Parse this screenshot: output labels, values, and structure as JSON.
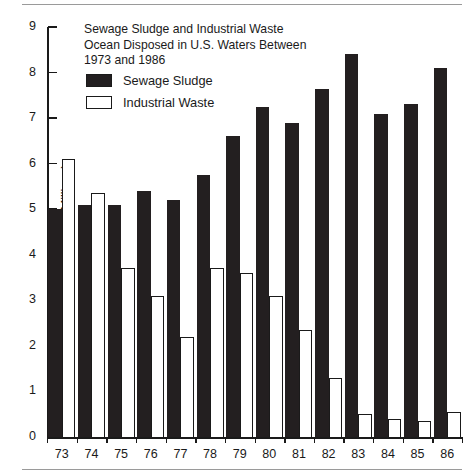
{
  "chart_data": {
    "type": "bar",
    "title": "Sewage Sludge and Industrial Waste\nOcean Disposed in U.S. Waters Between\n1973 and 1986",
    "title_lines": [
      "Sewage Sludge and Industrial Waste",
      "Ocean Disposed in U.S. Waters Between",
      "1973 and 1986"
    ],
    "xlabel": "",
    "ylabel": "Wet Tons (Millions)",
    "ylim": [
      0,
      9
    ],
    "ytick_labels": [
      "0",
      "1",
      "2",
      "3",
      "4",
      "5",
      "6",
      "7",
      "8",
      "9"
    ],
    "yticks": [
      0,
      1,
      2,
      3,
      4,
      5,
      6,
      7,
      8,
      9
    ],
    "grid": false,
    "legend_position": "upper-left-inside",
    "categories": [
      "73",
      "74",
      "75",
      "76",
      "77",
      "78",
      "79",
      "80",
      "81",
      "82",
      "83",
      "84",
      "85",
      "86"
    ],
    "series": [
      {
        "name": "Sewage Sludge",
        "color": "#231f20",
        "style": "filled",
        "values": [
          5.0,
          5.1,
          5.1,
          5.4,
          5.2,
          5.75,
          6.6,
          7.25,
          6.9,
          7.65,
          8.4,
          7.1,
          7.3,
          8.1
        ]
      },
      {
        "name": "Industrial Waste",
        "color": "#ffffff",
        "style": "hollow-outlined",
        "values": [
          6.1,
          5.35,
          3.7,
          3.1,
          2.2,
          3.7,
          3.6,
          3.1,
          2.35,
          1.3,
          0.5,
          0.4,
          0.35,
          0.55
        ]
      }
    ]
  },
  "colors": {
    "ink": "#1a1a1a",
    "bar_fill": "#231f20",
    "background": "#ffffff",
    "rule": "#9a9a9a"
  }
}
